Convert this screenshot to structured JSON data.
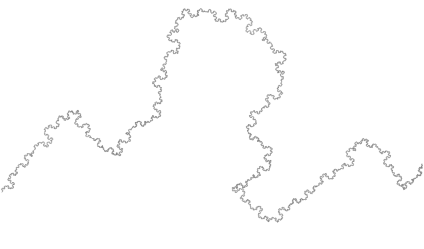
{
  "figure": {
    "type": "fractal-curve",
    "stroke_color": "#6e6e6e",
    "background_color": "#ffffff",
    "stroke_width": 0.55,
    "recursion_depth": 3,
    "path_points": [
      [
        2,
        192
      ],
      [
        16,
        168
      ],
      [
        34,
        150
      ],
      [
        58,
        118
      ],
      [
        78,
        110
      ],
      [
        92,
        138
      ],
      [
        104,
        150
      ],
      [
        120,
        156
      ],
      [
        132,
        128
      ],
      [
        150,
        122
      ],
      [
        160,
        96
      ],
      [
        166,
        62
      ],
      [
        176,
        20
      ],
      [
        206,
        12
      ],
      [
        246,
        14
      ],
      [
        272,
        44
      ],
      [
        282,
        82
      ],
      [
        262,
        108
      ],
      [
        248,
        132
      ],
      [
        262,
        142
      ],
      [
        270,
        168
      ],
      [
        250,
        180
      ],
      [
        232,
        188
      ],
      [
        250,
        206
      ],
      [
        268,
        222
      ],
      [
        290,
        204
      ],
      [
        304,
        200
      ],
      [
        318,
        186
      ],
      [
        340,
        170
      ],
      [
        356,
        142
      ],
      [
        378,
        148
      ],
      [
        392,
        172
      ],
      [
        404,
        190
      ],
      [
        416,
        178
      ],
      [
        422,
        164
      ]
    ]
  },
  "caption": {
    "text": ""
  }
}
